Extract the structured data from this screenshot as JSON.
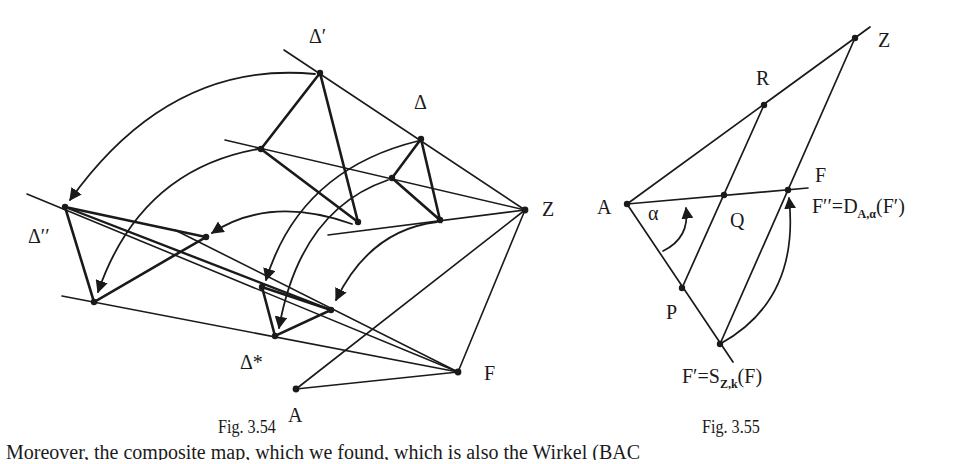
{
  "figures": [
    {
      "caption": "Fig. 3.54",
      "labels": {
        "delta_prime": "Δ′",
        "delta": "Δ",
        "z": "Z",
        "delta_double_prime": "Δ′′",
        "delta_star": "Δ*",
        "f": "F",
        "a": "A"
      }
    },
    {
      "caption": "Fig. 3.55",
      "labels": {
        "z": "Z",
        "r": "R",
        "a": "A",
        "alpha": "α",
        "q": "Q",
        "f": "F",
        "f_double_prime_lhs": "F′′=D",
        "f_double_prime_sub": "A,α",
        "f_double_prime_rhs": "(F′)",
        "p": "P",
        "f_prime_lhs": "F′=S",
        "f_prime_sub": "Z,k",
        "f_prime_rhs": "(F)"
      }
    }
  ],
  "body_text": {
    "clipped_line": "Moreover, the composite map, which we found, which is also the Wirkel (BAC"
  }
}
